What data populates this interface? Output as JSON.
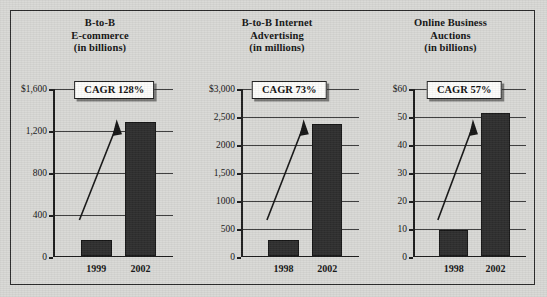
{
  "figure": {
    "background_color": "#d9d9d6",
    "border_color": "#2b2b2b",
    "bar_color": "#2e2e2e"
  },
  "chart_data": [
    {
      "type": "bar",
      "title": "B-to-B E-commerce (in billions)",
      "title_lines": [
        "B-to-B",
        "E-commerce",
        "(in billions)"
      ],
      "categories": [
        "1999",
        "2002"
      ],
      "values": [
        145,
        1270
      ],
      "xlabel": "",
      "ylabel": "",
      "ylim": [
        0,
        1600
      ],
      "yticks": [
        0,
        400,
        800,
        1200,
        1600
      ],
      "ytick_labels": [
        "0",
        "400",
        "800",
        "1,200",
        "$1,600"
      ],
      "grid": true,
      "annotation": "CAGR 128%",
      "annotation_value": "128%",
      "trend_arrow": true
    },
    {
      "type": "bar",
      "title": "B-to-B Internet Advertising (in millions)",
      "title_lines": [
        "B-to-B Internet",
        "Advertising",
        "(in millions)"
      ],
      "categories": [
        "1998",
        "2002"
      ],
      "values": [
        280,
        2350
      ],
      "xlabel": "",
      "ylabel": "",
      "ylim": [
        0,
        3000
      ],
      "yticks": [
        0,
        500,
        1000,
        1500,
        2000,
        2500,
        3000
      ],
      "ytick_labels": [
        "0",
        "500",
        "1000",
        "1,500",
        "2000",
        "2,500",
        "$3,000"
      ],
      "grid": true,
      "annotation": "CAGR 73%",
      "annotation_value": "73%",
      "trend_arrow": true
    },
    {
      "type": "bar",
      "title": "Online Business Auctions (in billions)",
      "title_lines": [
        "Online Business",
        "Auctions",
        "(in billions)"
      ],
      "categories": [
        "1998",
        "2002"
      ],
      "values": [
        9,
        51
      ],
      "xlabel": "",
      "ylabel": "",
      "ylim": [
        0,
        60
      ],
      "yticks": [
        0,
        10,
        20,
        30,
        40,
        50,
        60
      ],
      "ytick_labels": [
        "0",
        "10",
        "20",
        "30",
        "40",
        "50",
        "$60"
      ],
      "grid": true,
      "annotation": "CAGR 57%",
      "annotation_value": "57%",
      "trend_arrow": true
    }
  ]
}
